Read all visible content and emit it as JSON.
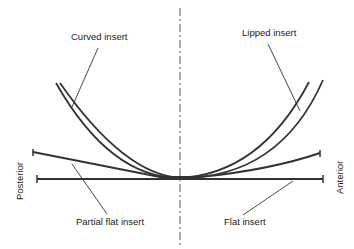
{
  "diagram": {
    "labels": {
      "curved": "Curved insert",
      "lipped": "Lipped insert",
      "partial_flat": "Partial flat insert",
      "flat": "Flat insert",
      "posterior": "Posterior",
      "anterior": "Anterior"
    },
    "colors": {
      "line": "#333333",
      "text": "#222222",
      "background": "#ffffff"
    }
  }
}
